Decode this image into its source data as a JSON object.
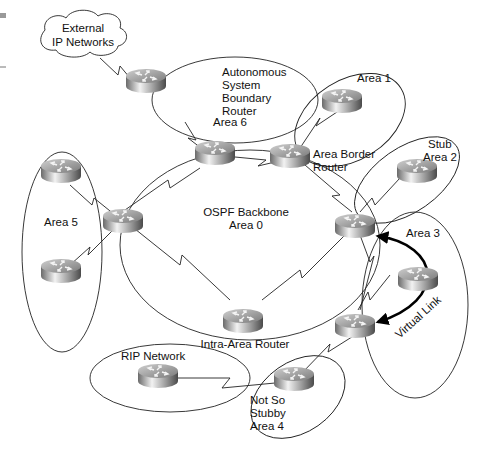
{
  "diagram": {
    "cloud": {
      "lines": [
        "External",
        "IP Networks"
      ]
    },
    "areas": [
      {
        "id": "area6",
        "lines": [
          "Area 6"
        ]
      },
      {
        "id": "area1",
        "lines": [
          "Area 1"
        ]
      },
      {
        "id": "area2",
        "lines": [
          "Stub",
          "Area 2"
        ]
      },
      {
        "id": "area3",
        "lines": [
          "Area 3"
        ]
      },
      {
        "id": "area5",
        "lines": [
          "Area 5"
        ]
      },
      {
        "id": "area0",
        "lines": [
          "OSPF Backbone",
          "Area 0"
        ]
      },
      {
        "id": "area4",
        "lines": [
          "Not So",
          "Stubby",
          "Area 4"
        ]
      },
      {
        "id": "rip",
        "lines": [
          "RIP Network"
        ]
      }
    ],
    "router_labels": {
      "asbr": [
        "Autonomous",
        "System",
        "Boundary",
        "Router"
      ],
      "abr": [
        "Area Border",
        "Router"
      ],
      "intra": [
        "Intra-Area Router"
      ]
    },
    "virtual_link_label": "Virtual Link",
    "colors": {
      "line": "#222222",
      "router_dark": "#555555",
      "router_light": "#e8e8e8"
    }
  }
}
